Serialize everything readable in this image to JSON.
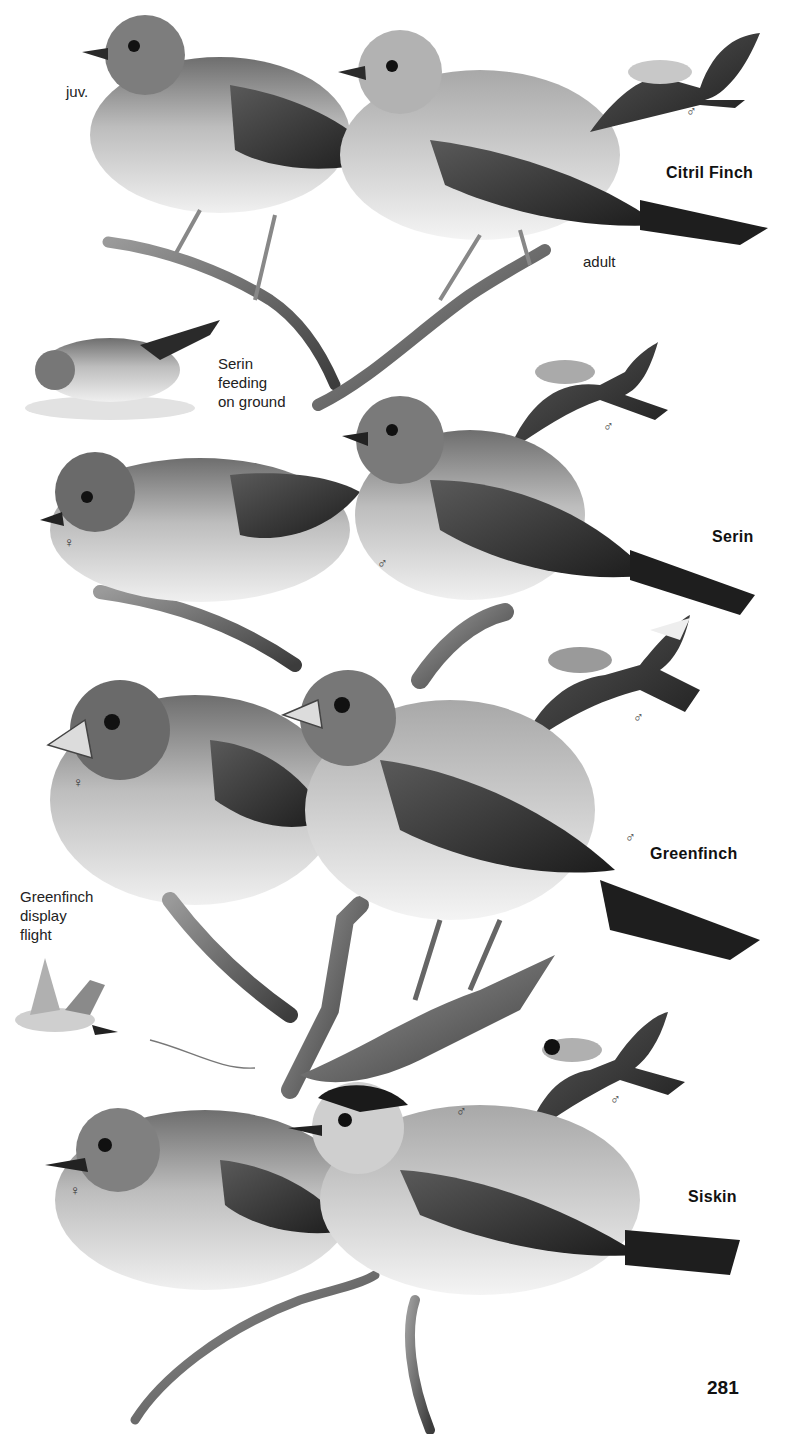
{
  "page": {
    "number": "281",
    "background": "#ffffff"
  },
  "species": [
    {
      "name": "Citril Finch",
      "labels": {
        "juvenile": "juv.",
        "adult": "adult"
      },
      "sex_marks": {
        "flight_male": "♂"
      }
    },
    {
      "name": "Serin",
      "labels": {
        "feeding": "Serin\nfeeding\non ground"
      },
      "sex_marks": {
        "flight_male": "♂",
        "perched_female": "♀",
        "perched_male": "♂"
      }
    },
    {
      "name": "Greenfinch",
      "labels": {
        "display": "Greenfinch\ndisplay\nflight"
      },
      "sex_marks": {
        "flight_male": "♂",
        "perched_female": "♀",
        "perched_male": "♂"
      }
    },
    {
      "name": "Siskin",
      "sex_marks": {
        "flight_male": "♂",
        "perched_female": "♀",
        "perched_male": "♂"
      }
    }
  ],
  "colors": {
    "ink": "#1a1a1a",
    "mid_grey": "#8a8a8a",
    "light_grey": "#d6d6d6",
    "dark_grey": "#3a3a3a"
  }
}
